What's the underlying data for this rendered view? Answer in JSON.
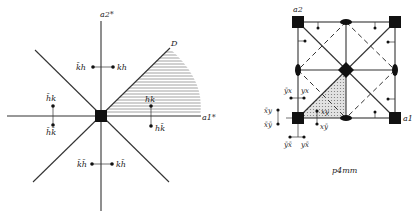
{
  "left_diagram": {
    "axis_a2_label": "a2*",
    "axis_a1_label": "a1*",
    "region_label": "D",
    "points": [
      {
        "label": "k̄h",
        "pos": "upper-left"
      },
      {
        "label": "kh",
        "pos": "upper-right"
      },
      {
        "label": "h̄k",
        "pos": "left-upper"
      },
      {
        "label": "h̄k̄",
        "pos": "left-lower"
      },
      {
        "label": "hk",
        "pos": "right-upper"
      },
      {
        "label": "hk̄",
        "pos": "right-lower"
      },
      {
        "label": "k̄h̄",
        "pos": "lower-left"
      },
      {
        "label": "kh̄",
        "pos": "lower-right"
      }
    ]
  },
  "right_diagram": {
    "axis_a2_label": "a2",
    "axis_a1_label": "a1",
    "caption": "p4mm",
    "points": [
      {
        "label": "ȳx",
        "pos": "upper-left"
      },
      {
        "label": "yx",
        "pos": "upper-right"
      },
      {
        "label": "x̄y",
        "pos": "left-upper"
      },
      {
        "label": "x̄ȳ",
        "pos": "left-lower"
      },
      {
        "label": "xy",
        "pos": "inner"
      },
      {
        "label": "xȳ",
        "pos": "inner-lower"
      },
      {
        "label": "ȳx̄",
        "pos": "lower-left"
      },
      {
        "label": "yx̄",
        "pos": "lower-right"
      }
    ]
  },
  "colors": {
    "ink": "#111111",
    "background": "#ffffff",
    "shading": "#bdbdbd"
  }
}
